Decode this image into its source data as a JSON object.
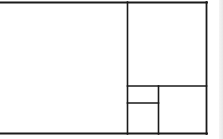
{
  "diagram": {
    "type": "golden-rectangle-subdivision",
    "stroke_color": "#1a1a1a",
    "background": "#ffffff",
    "outer_rect": {
      "x": 0,
      "y": 2.5,
      "width": 206.5,
      "height": 131
    },
    "lines": [
      {
        "id": "top-border",
        "x1": 0,
        "y1": 2.5,
        "x2": 207,
        "y2": 2.5,
        "width": 1.8
      },
      {
        "id": "bottom-border",
        "x1": 0,
        "y1": 133.5,
        "x2": 207,
        "y2": 133.5,
        "width": 1.8
      },
      {
        "id": "right-border",
        "x1": 206.5,
        "y1": 2,
        "x2": 206.5,
        "y2": 134,
        "width": 1.8
      },
      {
        "id": "main-vertical-divider",
        "x1": 127.5,
        "y1": 2,
        "x2": 127.5,
        "y2": 134,
        "width": 1.6
      },
      {
        "id": "right-column-horizontal-divider",
        "x1": 127.5,
        "y1": 86,
        "x2": 206.5,
        "y2": 86,
        "width": 1.6
      },
      {
        "id": "inner-vertical-divider",
        "x1": 158.5,
        "y1": 86,
        "x2": 158.5,
        "y2": 134,
        "width": 1.6
      },
      {
        "id": "small-horizontal-divider",
        "x1": 127.5,
        "y1": 103,
        "x2": 158.5,
        "y2": 103,
        "width": 1.6
      }
    ],
    "regions": [
      {
        "id": "large-square",
        "x": 0,
        "y": 2.5,
        "w": 127.5,
        "h": 131
      },
      {
        "id": "upper-right-square",
        "x": 127.5,
        "y": 2.5,
        "w": 79,
        "h": 83.5
      },
      {
        "id": "lower-right-square",
        "x": 158.5,
        "y": 86,
        "w": 48,
        "h": 47.5
      },
      {
        "id": "small-upper-rect",
        "x": 127.5,
        "y": 86,
        "w": 31,
        "h": 17
      },
      {
        "id": "small-lower-square",
        "x": 127.5,
        "y": 103,
        "w": 31,
        "h": 30.5
      }
    ]
  }
}
